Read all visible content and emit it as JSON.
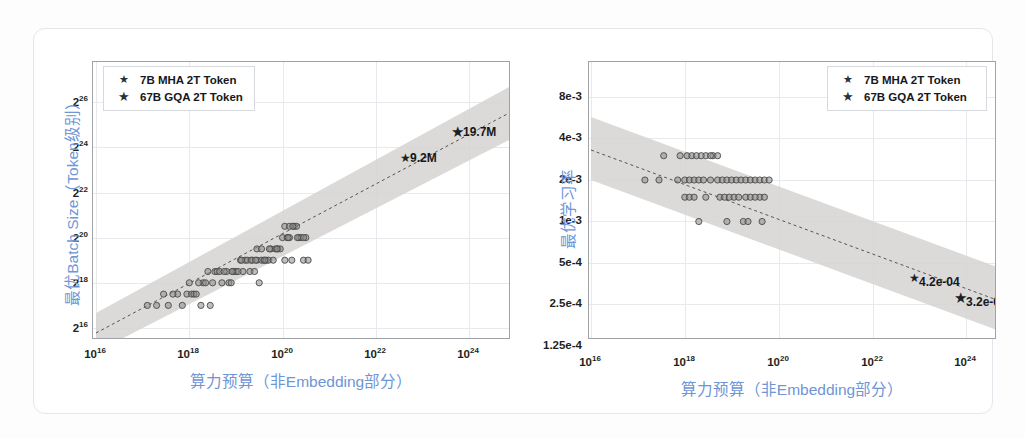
{
  "page": {
    "background": "#fdfdfd",
    "top_bleed_text": "·  ·   ·    ·     ·      ·       ·",
    "card_border_color": "#e3e6ea"
  },
  "style": {
    "axis_title_color": "#6e95d6",
    "tick_color": "#1d1f22",
    "grid_color": "#e7e9ec",
    "frame_color": "#9fa3a8",
    "band_color": "#d4d2cf",
    "trend_color": "#5a5a5a",
    "point_color": "#7d7d7d",
    "star_color": "#1b1f26"
  },
  "legend": {
    "items": [
      {
        "marker": "star-small-icon",
        "label": "7B MHA 2T Token"
      },
      {
        "marker": "star-large-icon",
        "label": "67B GQA 2T Token"
      }
    ]
  },
  "chart_data": [
    {
      "id": "batch-size",
      "type": "scatter",
      "title": "",
      "xlabel": "算力预算（非Embedding部分）",
      "ylabel": "最优Batch Size（Token级别）",
      "xscale": "log10",
      "yscale": "log2",
      "xlim": [
        16,
        25.1
      ],
      "ylim": [
        14.6,
        26.7
      ],
      "xticks": [
        16,
        18,
        20,
        22,
        24
      ],
      "xtick_labels": [
        "10^16",
        "10^18",
        "10^20",
        "10^22",
        "10^24"
      ],
      "yticks": [
        16,
        18,
        20,
        22,
        24,
        26
      ],
      "ytick_labels": [
        "2^16",
        "2^18",
        "2^20",
        "2^22",
        "2^24",
        "2^26"
      ],
      "grid": true,
      "legend_position": "top-left",
      "trendline": {
        "style": "dashed",
        "x0": 16,
        "y0": 15.35,
        "x1": 25.1,
        "y1": 25.1
      },
      "confidence_band": {
        "half_width_dex": 0.95
      },
      "annotations": [
        {
          "label": "9.2M",
          "x": 22.75,
          "y": 22.85,
          "marker": "star-small-icon"
        },
        {
          "label": "19.7M",
          "x": 23.95,
          "y": 24.0,
          "marker": "star-large-icon"
        }
      ],
      "points": [
        [
          17.1,
          17.0
        ],
        [
          17.45,
          17.5
        ],
        [
          17.55,
          17.0
        ],
        [
          17.75,
          17.5
        ],
        [
          17.85,
          17.0
        ],
        [
          17.95,
          17.5
        ],
        [
          18.0,
          18.0
        ],
        [
          18.05,
          17.5
        ],
        [
          18.1,
          17.5
        ],
        [
          18.25,
          17.0
        ],
        [
          18.3,
          18.0
        ],
        [
          18.4,
          18.5
        ],
        [
          18.45,
          17.0
        ],
        [
          18.55,
          18.5
        ],
        [
          18.6,
          18.5
        ],
        [
          18.65,
          18.5
        ],
        [
          18.7,
          18.0
        ],
        [
          18.8,
          18.5
        ],
        [
          18.85,
          18.0
        ],
        [
          18.9,
          18.0
        ],
        [
          18.95,
          18.5
        ],
        [
          19.0,
          18.5
        ],
        [
          19.05,
          18.5
        ],
        [
          19.1,
          19.0
        ],
        [
          19.15,
          18.5
        ],
        [
          19.2,
          19.0
        ],
        [
          19.25,
          19.0
        ],
        [
          19.3,
          18.5
        ],
        [
          19.35,
          19.0
        ],
        [
          19.4,
          18.5
        ],
        [
          19.45,
          19.0
        ],
        [
          19.5,
          18.0
        ],
        [
          19.55,
          19.0
        ],
        [
          19.6,
          19.0
        ],
        [
          19.65,
          19.0
        ],
        [
          19.7,
          19.0
        ],
        [
          19.75,
          19.5
        ],
        [
          19.8,
          19.0
        ],
        [
          19.85,
          19.5
        ],
        [
          19.9,
          19.5
        ],
        [
          19.95,
          19.5
        ],
        [
          20.0,
          20.0
        ],
        [
          20.05,
          19.0
        ],
        [
          20.1,
          20.0
        ],
        [
          20.15,
          20.0
        ],
        [
          20.2,
          19.0
        ],
        [
          20.25,
          20.5
        ],
        [
          20.3,
          20.5
        ],
        [
          20.35,
          20.0
        ],
        [
          20.4,
          20.0
        ],
        [
          20.45,
          19.0
        ],
        [
          20.5,
          20.0
        ],
        [
          18.2,
          18.0
        ],
        [
          18.35,
          18.0
        ],
        [
          19.45,
          19.5
        ],
        [
          19.55,
          19.5
        ],
        [
          20.05,
          20.5
        ],
        [
          20.15,
          20.5
        ],
        [
          20.45,
          20.0
        ],
        [
          20.55,
          19.0
        ],
        [
          17.3,
          17.0
        ],
        [
          17.65,
          17.5
        ],
        [
          18.15,
          17.5
        ],
        [
          18.5,
          18.0
        ],
        [
          18.75,
          18.5
        ],
        [
          19.12,
          19.0
        ],
        [
          19.33,
          19.0
        ],
        [
          19.62,
          19.0
        ],
        [
          19.88,
          19.5
        ],
        [
          20.12,
          20.0
        ],
        [
          20.32,
          20.0
        ],
        [
          20.22,
          20.5
        ],
        [
          19.72,
          19.5
        ],
        [
          19.42,
          19.0
        ],
        [
          18.92,
          18.5
        ]
      ]
    },
    {
      "id": "learning-rate",
      "type": "scatter",
      "title": "",
      "xlabel": "算力预算（非Embedding部分）",
      "ylabel": "最优学习率",
      "xscale": "log10",
      "yscale": "log2",
      "xlim": [
        16,
        25.1
      ],
      "ylim": [
        -12.97,
        -6.97
      ],
      "xticks": [
        16,
        18,
        20,
        22,
        24
      ],
      "xtick_labels": [
        "10^16",
        "10^18",
        "10^20",
        "10^22",
        "10^24"
      ],
      "ytick_values": [
        0.008,
        0.004,
        0.002,
        0.001,
        0.0005,
        0.00025,
        0.000125
      ],
      "ytick_labels": [
        "8e-3",
        "4e-3",
        "2e-3",
        "1e-3",
        "5e-4",
        "2.5e-4",
        "1.25e-4"
      ],
      "grid": true,
      "legend_position": "top-right",
      "trendline": {
        "style": "dashed",
        "x0": 16,
        "y0": 0.00305,
        "x1": 25.1,
        "y1": 0.000275
      },
      "confidence_band": {
        "half_width_ratio": 1.55
      },
      "annotations": [
        {
          "label": "4.2e-04",
          "x": 22.9,
          "y": 0.00042,
          "marker": "star-small-icon"
        },
        {
          "label": "3.2e-04",
          "x": 23.95,
          "y": 0.00032,
          "marker": "star-large-icon"
        }
      ],
      "points": [
        [
          17.55,
          0.003
        ],
        [
          17.9,
          0.003
        ],
        [
          18.05,
          0.003
        ],
        [
          18.15,
          0.003
        ],
        [
          18.25,
          0.003
        ],
        [
          18.45,
          0.003
        ],
        [
          18.6,
          0.003
        ],
        [
          18.7,
          0.003
        ],
        [
          17.15,
          0.002
        ],
        [
          17.45,
          0.002
        ],
        [
          17.85,
          0.002
        ],
        [
          18.0,
          0.002
        ],
        [
          18.1,
          0.002
        ],
        [
          18.2,
          0.002
        ],
        [
          18.3,
          0.002
        ],
        [
          18.4,
          0.002
        ],
        [
          18.7,
          0.002
        ],
        [
          18.8,
          0.002
        ],
        [
          18.9,
          0.002
        ],
        [
          19.0,
          0.002
        ],
        [
          19.1,
          0.002
        ],
        [
          19.2,
          0.002
        ],
        [
          19.3,
          0.002
        ],
        [
          19.4,
          0.002
        ],
        [
          19.5,
          0.002
        ],
        [
          19.6,
          0.002
        ],
        [
          19.7,
          0.002
        ],
        [
          19.8,
          0.002
        ],
        [
          18.0,
          0.0015
        ],
        [
          18.1,
          0.0015
        ],
        [
          18.2,
          0.0015
        ],
        [
          18.45,
          0.0015
        ],
        [
          18.75,
          0.0015
        ],
        [
          18.85,
          0.0015
        ],
        [
          18.95,
          0.0015
        ],
        [
          19.05,
          0.0015
        ],
        [
          19.3,
          0.0015
        ],
        [
          19.4,
          0.0015
        ],
        [
          19.6,
          0.0015
        ],
        [
          19.7,
          0.0015
        ],
        [
          18.3,
          0.001
        ],
        [
          18.9,
          0.001
        ],
        [
          19.25,
          0.001
        ],
        [
          19.35,
          0.001
        ],
        [
          19.65,
          0.001
        ],
        [
          18.35,
          0.003
        ],
        [
          18.55,
          0.003
        ],
        [
          19.15,
          0.0015
        ],
        [
          19.5,
          0.0015
        ],
        [
          18.55,
          0.002
        ]
      ]
    }
  ]
}
